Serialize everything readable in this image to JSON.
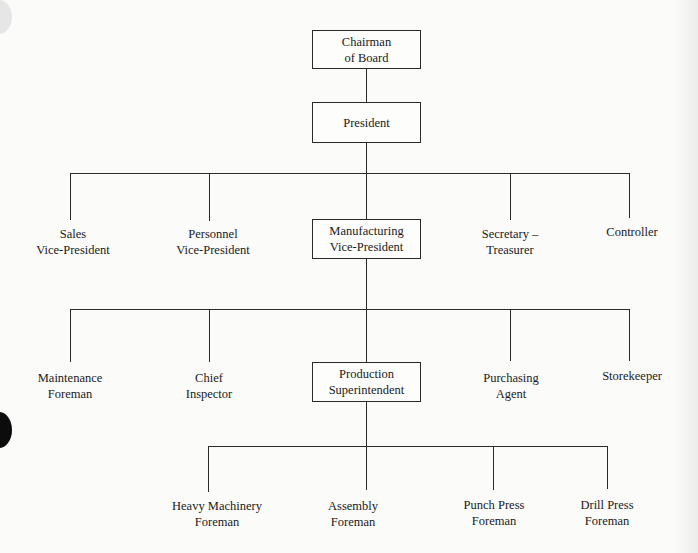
{
  "diagram": {
    "type": "organization-chart",
    "root": {
      "label_lines": [
        "Chairman",
        "of Board"
      ],
      "boxed": true
    },
    "level1": {
      "label_lines": [
        "President"
      ],
      "boxed": true
    },
    "level2": [
      {
        "label_lines": [
          "Sales",
          "Vice-President"
        ],
        "boxed": false
      },
      {
        "label_lines": [
          "Personnel",
          "Vice-President"
        ],
        "boxed": false
      },
      {
        "label_lines": [
          "Manufacturing",
          "Vice-President"
        ],
        "boxed": true
      },
      {
        "label_lines": [
          "Secretary –",
          "Treasurer"
        ],
        "boxed": false
      },
      {
        "label_lines": [
          "Controller"
        ],
        "boxed": false
      }
    ],
    "level3": [
      {
        "label_lines": [
          "Maintenance",
          "Foreman"
        ],
        "boxed": false
      },
      {
        "label_lines": [
          "Chief",
          "Inspector"
        ],
        "boxed": false
      },
      {
        "label_lines": [
          "Production",
          "Superintendent"
        ],
        "boxed": true
      },
      {
        "label_lines": [
          "Purchasing",
          "Agent"
        ],
        "boxed": false
      },
      {
        "label_lines": [
          "Storekeeper"
        ],
        "boxed": false
      }
    ],
    "level4": [
      {
        "label_lines": [
          "Heavy Machinery",
          "Foreman"
        ],
        "boxed": false
      },
      {
        "label_lines": [
          "Assembly",
          "Foreman"
        ],
        "boxed": false
      },
      {
        "label_lines": [
          "Punch Press",
          "Foreman"
        ],
        "boxed": false
      },
      {
        "label_lines": [
          "Drill Press",
          "Foreman"
        ],
        "boxed": false
      }
    ]
  }
}
